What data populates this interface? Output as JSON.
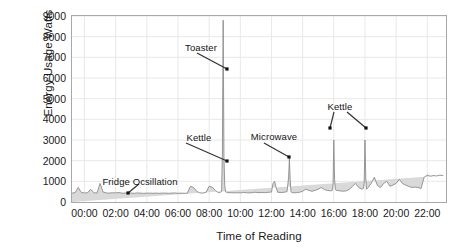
{
  "chart_data": {
    "type": "area",
    "title": "",
    "xlabel": "Time of Reading",
    "ylabel": "Energy Usage Watts",
    "ylim": [
      0,
      9000
    ],
    "ytick_values": [
      0,
      1000,
      2000,
      3000,
      4000,
      5000,
      6000,
      7000,
      8000,
      9000
    ],
    "ytick_labels": [
      "0",
      "1000",
      "2000",
      "3000",
      "4000",
      "5000",
      "6000",
      "7000",
      "8000",
      "9000"
    ],
    "xlim": [
      -0.8,
      23.2
    ],
    "xtick_values": [
      0,
      2,
      4,
      6,
      8,
      10,
      12,
      14,
      16,
      18,
      20,
      22
    ],
    "xtick_labels": [
      "00:00",
      "02:00",
      "04:00",
      "06:00",
      "08:00",
      "10:00",
      "12:00",
      "14:00",
      "16:00",
      "18:00",
      "20:00",
      "22:00"
    ],
    "grid": true,
    "legend": "none",
    "series_name": "Energy Usage",
    "line_color": "#8c8c8c",
    "fill_color": "#d9d9d9",
    "grid_color": "#e8e8e8",
    "frame_color": "#a8a8a8",
    "x": [
      -0.8,
      -0.6,
      -0.4,
      -0.2,
      0.0,
      0.2,
      0.4,
      0.6,
      0.8,
      1.0,
      1.2,
      1.4,
      1.6,
      1.8,
      2.0,
      2.2,
      2.4,
      2.6,
      2.8,
      3.0,
      3.2,
      3.4,
      3.6,
      3.8,
      4.0,
      4.2,
      4.4,
      4.6,
      4.8,
      5.0,
      5.2,
      5.4,
      5.6,
      5.8,
      6.0,
      6.2,
      6.4,
      6.6,
      6.8,
      7.0,
      7.2,
      7.4,
      7.6,
      7.8,
      8.0,
      8.2,
      8.4,
      8.6,
      8.7,
      8.8,
      8.85,
      8.9,
      8.95,
      9.0,
      9.05,
      9.1,
      9.2,
      9.4,
      9.6,
      9.8,
      10.0,
      10.2,
      10.4,
      10.6,
      10.8,
      11.0,
      11.2,
      11.4,
      11.6,
      11.8,
      12.0,
      12.1,
      12.2,
      12.3,
      12.4,
      12.6,
      12.8,
      13.0,
      13.1,
      13.15,
      13.2,
      13.25,
      13.3,
      13.4,
      13.6,
      13.8,
      14.0,
      14.2,
      14.4,
      14.6,
      14.8,
      15.0,
      15.2,
      15.4,
      15.6,
      15.8,
      15.9,
      15.95,
      16.0,
      16.05,
      16.1,
      16.2,
      16.4,
      16.6,
      16.8,
      17.0,
      17.2,
      17.4,
      17.6,
      17.8,
      17.9,
      17.95,
      18.0,
      18.05,
      18.1,
      18.2,
      18.4,
      18.6,
      18.8,
      19.0,
      19.2,
      19.4,
      19.6,
      19.8,
      20.0,
      20.2,
      20.4,
      20.6,
      20.8,
      21.0,
      21.2,
      21.4,
      21.6,
      21.8,
      22.0,
      22.2,
      22.4,
      22.6,
      22.8,
      23.0,
      23.2
    ],
    "y": [
      430,
      450,
      700,
      460,
      440,
      450,
      620,
      450,
      430,
      900,
      480,
      440,
      430,
      450,
      440,
      460,
      430,
      430,
      450,
      430,
      420,
      440,
      430,
      420,
      430,
      430,
      420,
      430,
      420,
      430,
      430,
      420,
      430,
      440,
      420,
      430,
      420,
      430,
      760,
      700,
      520,
      440,
      430,
      470,
      760,
      720,
      560,
      450,
      470,
      500,
      2300,
      8800,
      2200,
      820,
      520,
      470,
      450,
      450,
      440,
      450,
      440,
      460,
      450,
      440,
      460,
      470,
      450,
      460,
      450,
      470,
      480,
      900,
      1000,
      700,
      470,
      460,
      470,
      500,
      1200,
      2100,
      1100,
      520,
      460,
      450,
      450,
      470,
      520,
      620,
      560,
      520,
      560,
      620,
      700,
      600,
      560,
      540,
      560,
      800,
      3000,
      1100,
      600,
      560,
      540,
      520,
      540,
      620,
      760,
      900,
      700,
      620,
      660,
      900,
      3000,
      1200,
      620,
      700,
      900,
      1200,
      800,
      700,
      900,
      1000,
      760,
      820,
      900,
      1100,
      900,
      820,
      760,
      700,
      720,
      700,
      660,
      1200,
      1300,
      1250,
      1280,
      1260,
      1300,
      1280
    ],
    "annotations": [
      {
        "label": "Toaster",
        "label_x": 201,
        "label_y": 42,
        "line_x1": 197,
        "line_y1": 53,
        "line_x2": 227,
        "line_y2": 69,
        "dot_x": 227,
        "dot_y": 69
      },
      {
        "label": "Kettle",
        "label_x": 199,
        "label_y": 132,
        "line_x1": 186,
        "line_y1": 143,
        "line_x2": 227,
        "line_y2": 161,
        "dot_x": 227,
        "dot_y": 161
      },
      {
        "label": "Microwave",
        "label_x": 274,
        "label_y": 131,
        "line_x1": 264,
        "line_y1": 143,
        "line_x2": 289,
        "line_y2": 157,
        "dot_x": 289,
        "dot_y": 157
      },
      {
        "label": "Kettle",
        "label_x": 340,
        "label_y": 101,
        "line_x1": 334,
        "line_y1": 112,
        "line_x2": 330,
        "line_y2": 128,
        "dot_x": 330,
        "dot_y": 128
      },
      {
        "label": "Kettle2",
        "label_x": 340,
        "label_y": 101,
        "line_x1": 347,
        "line_y1": 112,
        "line_x2": 366,
        "line_y2": 128,
        "dot_x": 366,
        "dot_y": 128
      },
      {
        "label": "Fridge Ocsillation",
        "label_x": 140,
        "label_y": 176,
        "line_x1": 139,
        "line_y1": 184,
        "line_x2": 128,
        "line_y2": 193,
        "dot_x": 128,
        "dot_y": 193
      }
    ]
  }
}
